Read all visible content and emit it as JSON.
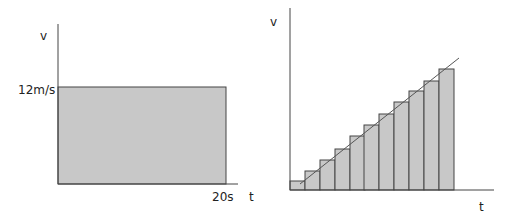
{
  "chart_data": [
    {
      "type": "area",
      "title": "",
      "xlabel": "t",
      "ylabel": "v",
      "description": "Constant velocity: shaded rectangle under v-t graph",
      "x": [
        0,
        20
      ],
      "values": [
        12,
        12
      ],
      "tick_labels": {
        "y": "12m/s",
        "x": "20s"
      },
      "units": {
        "x": "s",
        "y": "m/s"
      },
      "fill_color": "#c8c8c8"
    },
    {
      "type": "bar",
      "title": "",
      "xlabel": "t",
      "ylabel": "v",
      "description": "Uniform acceleration approximated by rectangular strips under a straight v-t line",
      "categories": [
        1,
        2,
        3,
        4,
        5,
        6,
        7,
        8,
        9,
        10,
        11
      ],
      "values": [
        1,
        2,
        3,
        4,
        5,
        6,
        7,
        8,
        9,
        10,
        11
      ],
      "line": {
        "type": "linear",
        "label": ""
      },
      "fill_color": "#c8c8c8"
    }
  ],
  "left": {
    "y_axis_label": "v",
    "x_axis_label": "t",
    "y_tick": "12m/s",
    "x_tick": "20s"
  },
  "right": {
    "y_axis_label": "v",
    "x_axis_label": "t",
    "bars": [
      {
        "x": 290,
        "top": 181
      },
      {
        "x": 305,
        "top": 171
      },
      {
        "x": 320,
        "top": 160
      },
      {
        "x": 335,
        "top": 149
      },
      {
        "x": 350,
        "top": 136
      },
      {
        "x": 364,
        "top": 125
      },
      {
        "x": 379,
        "top": 114
      },
      {
        "x": 394,
        "top": 102
      },
      {
        "x": 409,
        "top": 91
      },
      {
        "x": 424,
        "top": 81
      },
      {
        "x": 439,
        "top": 69
      }
    ]
  }
}
